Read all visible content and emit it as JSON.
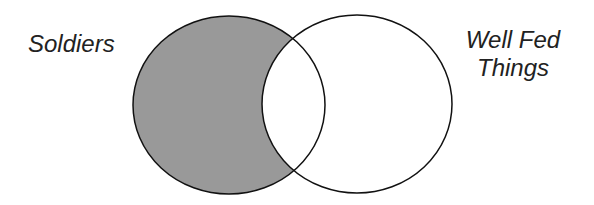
{
  "diagram": {
    "type": "venn",
    "sets": [
      {
        "label": "Soldiers",
        "shaded": true,
        "fill": "#999999"
      },
      {
        "label_lines": [
          "Well Fed",
          "Things"
        ],
        "shaded": false,
        "fill": "#ffffff"
      }
    ],
    "intersection_shaded": false,
    "stroke": "#111111"
  }
}
